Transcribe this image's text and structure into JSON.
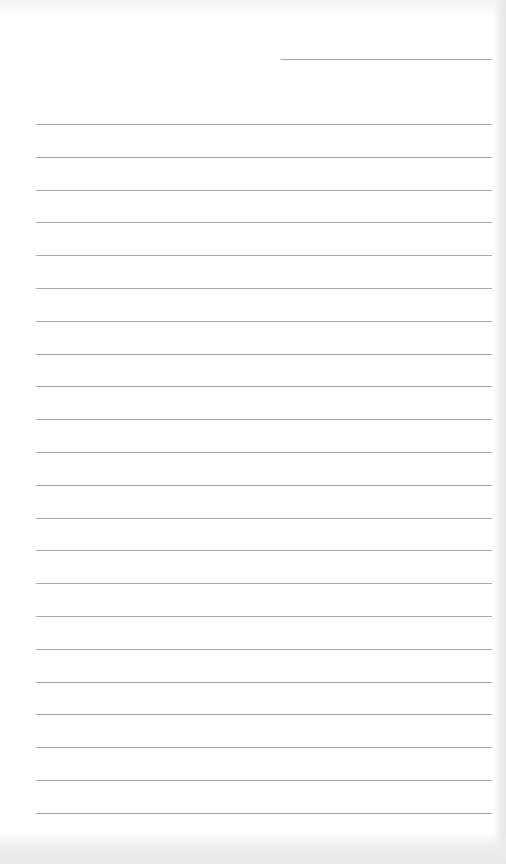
{
  "document": {
    "type": "lined-notebook-paper",
    "background_color": "#ffffff",
    "line_color": "#a8a8a8",
    "date_line": {
      "visible": true,
      "text": ""
    },
    "ruled_lines": {
      "count": 22,
      "first_y": 124,
      "spacing": 32.8,
      "left": 36,
      "right": 492,
      "entries": [
        "",
        "",
        "",
        "",
        "",
        "",
        "",
        "",
        "",
        "",
        "",
        "",
        "",
        "",
        "",
        "",
        "",
        "",
        "",
        "",
        "",
        ""
      ]
    }
  }
}
